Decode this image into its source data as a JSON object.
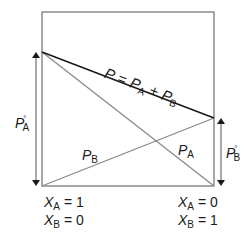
{
  "diagram": {
    "title": "",
    "colors": {
      "frame": "#7a7a7a",
      "total_line": "#1a1a1a",
      "partial_lines": "#8a8a8a",
      "arrows": "#1a1a1a",
      "text": "#1a1a1a"
    },
    "total_pressure_label": {
      "lhs": "P",
      "eq": " = ",
      "t1": "P",
      "t1_sub": "A",
      "plus": " + ",
      "t2": "P",
      "t2_sub": "B"
    },
    "partial_labels": {
      "pa": {
        "main": "P",
        "sub": "A"
      },
      "pb": {
        "main": "P",
        "sub": "B"
      }
    },
    "vapor_pressure_labels": {
      "pa_star": {
        "main": "P",
        "sub": "A",
        "sup": "°"
      },
      "pb_star": {
        "main": "P",
        "sub": "B",
        "sup": "°"
      }
    },
    "axis_endpoints": {
      "left": {
        "line1": {
          "var": "X",
          "sub": "A",
          "val": " = 1"
        },
        "line2": {
          "var": "X",
          "sub": "B",
          "val": " = 0"
        }
      },
      "right": {
        "line1": {
          "var": "X",
          "sub": "A",
          "val": " = 0"
        },
        "line2": {
          "var": "X",
          "sub": "B",
          "val": " = 1"
        }
      }
    }
  }
}
